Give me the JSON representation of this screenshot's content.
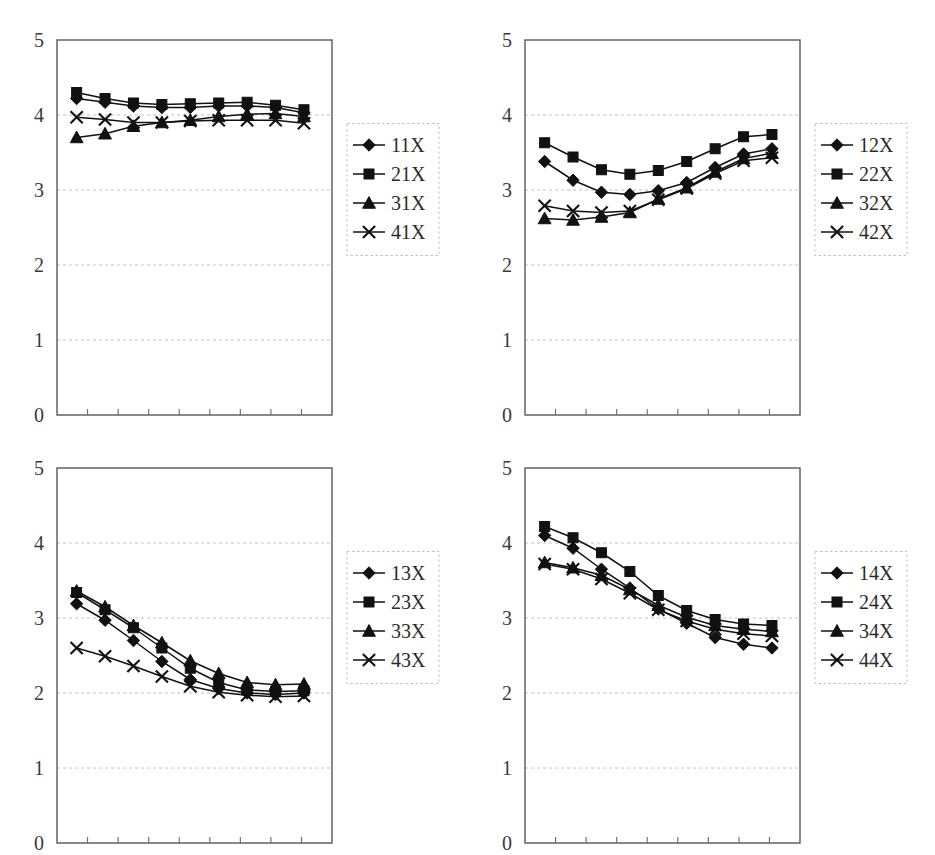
{
  "figure": {
    "background_color": "#ffffff",
    "line_color": "#111111",
    "grid_color": "#b9b9bb",
    "axis_color": "#58585a",
    "panel_count": 4,
    "layout": "2x2"
  },
  "chart_data": [
    {
      "type": "line",
      "title": "",
      "xlabel": "",
      "ylabel": "",
      "ylim": [
        0,
        5
      ],
      "yticks": [
        0,
        1,
        2,
        3,
        4,
        5
      ],
      "ytick_labels": [
        "0",
        "1",
        "2",
        "3",
        "4",
        "5"
      ],
      "grid": true,
      "grid_axis": "y",
      "legend_position": "right",
      "x": [
        1,
        2,
        3,
        4,
        5,
        6,
        7,
        8,
        9
      ],
      "n_points": 9,
      "series": [
        {
          "name": "11X",
          "marker": "diamond",
          "values": [
            4.22,
            4.17,
            4.12,
            4.1,
            4.1,
            4.12,
            4.12,
            4.1,
            4.03
          ]
        },
        {
          "name": "21X",
          "marker": "square",
          "values": [
            4.3,
            4.22,
            4.16,
            4.14,
            4.15,
            4.16,
            4.17,
            4.13,
            4.07
          ]
        },
        {
          "name": "31X",
          "marker": "triangle",
          "values": [
            3.7,
            3.75,
            3.85,
            3.9,
            3.93,
            3.98,
            4.01,
            4.02,
            3.98
          ]
        },
        {
          "name": "41X",
          "marker": "cross",
          "values": [
            3.97,
            3.94,
            3.9,
            3.9,
            3.92,
            3.93,
            3.93,
            3.93,
            3.89
          ]
        }
      ]
    },
    {
      "type": "line",
      "title": "",
      "xlabel": "",
      "ylabel": "",
      "ylim": [
        0,
        5
      ],
      "yticks": [
        0,
        1,
        2,
        3,
        4,
        5
      ],
      "ytick_labels": [
        "0",
        "1",
        "2",
        "3",
        "4",
        "5"
      ],
      "grid": true,
      "grid_axis": "y",
      "legend_position": "right",
      "x": [
        1,
        2,
        3,
        4,
        5,
        6,
        7,
        8,
        9
      ],
      "n_points": 9,
      "series": [
        {
          "name": "12X",
          "marker": "diamond",
          "values": [
            3.38,
            3.13,
            2.97,
            2.94,
            2.99,
            3.1,
            3.3,
            3.48,
            3.55
          ]
        },
        {
          "name": "22X",
          "marker": "square",
          "values": [
            3.63,
            3.44,
            3.27,
            3.21,
            3.26,
            3.38,
            3.55,
            3.71,
            3.74
          ]
        },
        {
          "name": "32X",
          "marker": "triangle",
          "values": [
            2.62,
            2.6,
            2.64,
            2.7,
            2.88,
            3.03,
            3.24,
            3.42,
            3.49
          ]
        },
        {
          "name": "42X",
          "marker": "cross",
          "values": [
            2.79,
            2.72,
            2.7,
            2.72,
            2.87,
            3.02,
            3.22,
            3.39,
            3.43
          ]
        }
      ]
    },
    {
      "type": "line",
      "title": "",
      "xlabel": "",
      "ylabel": "",
      "ylim": [
        0,
        5
      ],
      "yticks": [
        0,
        1,
        2,
        3,
        4,
        5
      ],
      "ytick_labels": [
        "0",
        "1",
        "2",
        "3",
        "4",
        "5"
      ],
      "grid": true,
      "grid_axis": "y",
      "legend_position": "right",
      "x": [
        1,
        2,
        3,
        4,
        5,
        6,
        7,
        8,
        9
      ],
      "n_points": 9,
      "series": [
        {
          "name": "13X",
          "marker": "diamond",
          "values": [
            3.19,
            2.97,
            2.7,
            2.42,
            2.18,
            2.06,
            2.0,
            1.98,
            2.0
          ]
        },
        {
          "name": "23X",
          "marker": "square",
          "values": [
            3.34,
            3.11,
            2.87,
            2.6,
            2.33,
            2.14,
            2.04,
            2.02,
            2.03
          ]
        },
        {
          "name": "33X",
          "marker": "triangle",
          "values": [
            3.36,
            3.15,
            2.9,
            2.67,
            2.43,
            2.26,
            2.14,
            2.11,
            2.12
          ]
        },
        {
          "name": "43X",
          "marker": "cross",
          "values": [
            2.6,
            2.49,
            2.36,
            2.22,
            2.09,
            2.01,
            1.97,
            1.95,
            1.96
          ]
        }
      ]
    },
    {
      "type": "line",
      "title": "",
      "xlabel": "",
      "ylabel": "",
      "ylim": [
        0,
        5
      ],
      "yticks": [
        0,
        1,
        2,
        3,
        4,
        5
      ],
      "ytick_labels": [
        "0",
        "1",
        "2",
        "3",
        "4",
        "5"
      ],
      "grid": true,
      "grid_axis": "y",
      "legend_position": "right",
      "x": [
        1,
        2,
        3,
        4,
        5,
        6,
        7,
        8,
        9
      ],
      "n_points": 9,
      "series": [
        {
          "name": "14X",
          "marker": "diamond",
          "values": [
            4.1,
            3.93,
            3.65,
            3.4,
            3.12,
            2.93,
            2.74,
            2.65,
            2.6
          ]
        },
        {
          "name": "24X",
          "marker": "square",
          "values": [
            4.22,
            4.07,
            3.87,
            3.62,
            3.3,
            3.1,
            2.98,
            2.92,
            2.9
          ]
        },
        {
          "name": "34X",
          "marker": "triangle",
          "values": [
            3.74,
            3.67,
            3.57,
            3.38,
            3.17,
            3.01,
            2.9,
            2.85,
            2.82
          ]
        },
        {
          "name": "44X",
          "marker": "cross",
          "values": [
            3.72,
            3.65,
            3.52,
            3.33,
            3.11,
            2.96,
            2.85,
            2.79,
            2.76
          ]
        }
      ]
    }
  ]
}
